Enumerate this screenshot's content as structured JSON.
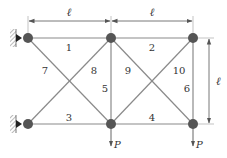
{
  "diagram": {
    "type": "truss",
    "colors": {
      "member": "#8a8a8a",
      "node": "#555555",
      "dimension": "#555555",
      "text": "#333333"
    },
    "dimensions": {
      "top_left_span": "ℓ",
      "top_right_span": "ℓ",
      "right_height": "ℓ"
    },
    "members": [
      {
        "id": "1",
        "label": "1"
      },
      {
        "id": "2",
        "label": "2"
      },
      {
        "id": "3",
        "label": "3"
      },
      {
        "id": "4",
        "label": "4"
      },
      {
        "id": "5",
        "label": "5"
      },
      {
        "id": "6",
        "label": "6"
      },
      {
        "id": "7",
        "label": "7"
      },
      {
        "id": "8",
        "label": "8"
      },
      {
        "id": "9",
        "label": "9"
      },
      {
        "id": "10",
        "label": "10"
      }
    ],
    "loads": [
      {
        "node": "bottom-middle",
        "label": "P"
      },
      {
        "node": "bottom-right",
        "label": "P"
      }
    ],
    "supports": [
      {
        "node": "top-left",
        "type": "wall-pin"
      },
      {
        "node": "bottom-left",
        "type": "wall-pin"
      }
    ]
  }
}
